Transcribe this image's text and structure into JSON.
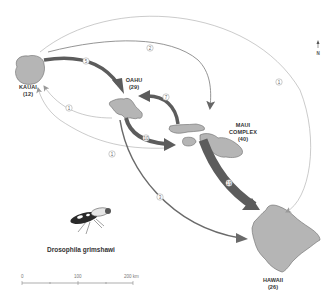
{
  "islands": [
    {
      "id": "kauai",
      "name": "KAUAI",
      "count": "(12)"
    },
    {
      "id": "oahu",
      "name": "OAHU",
      "count": "(29)"
    },
    {
      "id": "maui",
      "name": "MAUI",
      "name2": "COMPLEX",
      "count": "(40)"
    },
    {
      "id": "hawaii",
      "name": "HAWAII",
      "count": "(26)"
    }
  ],
  "routes": [
    {
      "from": "KAUAI",
      "to": "HAWAII",
      "label": "1",
      "weight": "thin"
    },
    {
      "from": "KAUAI",
      "to": "MAUI COMPLEX",
      "label": "2",
      "weight": "medium"
    },
    {
      "from": "KAUAI",
      "to": "OAHU",
      "label": "5",
      "weight": "thick"
    },
    {
      "from": "MAUI COMPLEX",
      "to": "OAHU",
      "label": "7",
      "weight": "thick"
    },
    {
      "from": "OAHU",
      "to": "KAUAI",
      "label": "1",
      "weight": "thin"
    },
    {
      "from": "MAUI COMPLEX",
      "to": "KAUAI",
      "label": "1",
      "weight": "thin"
    },
    {
      "from": "OAHU",
      "to": "MAUI COMPLEX",
      "label": "10",
      "weight": "thick"
    },
    {
      "from": "OAHU",
      "to": "HAWAII",
      "label": "3",
      "weight": "medium"
    },
    {
      "from": "MAUI COMPLEX",
      "to": "HAWAII",
      "label": "19",
      "weight": "very-thick"
    }
  ],
  "north_arrow": {
    "label": "N"
  },
  "species": {
    "name": "Drosophila grimshawi"
  },
  "scale_bar": {
    "ticks": [
      "0",
      "100",
      "200 km"
    ]
  },
  "colors": {
    "island_fill": "#b5b5b5",
    "island_stroke": "#6a6a6a",
    "arrow_dark": "#5c5c5c",
    "arrow_light": "#a8a8a8"
  }
}
